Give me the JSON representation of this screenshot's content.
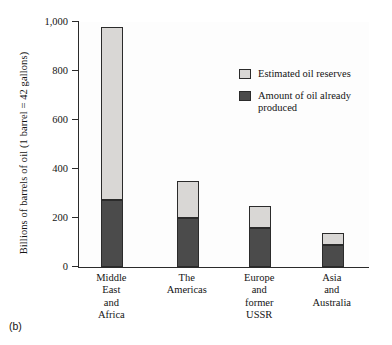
{
  "figure": {
    "panel_label": "(b)"
  },
  "legend": {
    "position": "inside-top-right",
    "entries": [
      {
        "label": "Estimated oil reserves",
        "color": "#d9d7d5",
        "swatch_name": "legend-swatch-reserves"
      },
      {
        "label": "Amount of oil already\nproduced",
        "color": "#4b4b4b",
        "swatch_name": "legend-swatch-produced"
      }
    ]
  },
  "chart_data": {
    "type": "bar",
    "subtype": "stacked",
    "title": "",
    "subtitle": "",
    "xlabel": "",
    "ylabel": "Billions of barrels of oil (1 barrel = 42 gallons)",
    "ylim": [
      0,
      1000
    ],
    "yticks": [
      0,
      200,
      400,
      600,
      800,
      1000
    ],
    "ytick_labels": [
      "0",
      "200",
      "400",
      "600",
      "800",
      "1,000"
    ],
    "grid": false,
    "legend_position": "inside-top-right",
    "categories": [
      "Middle\nEast\nand\nAfrica",
      "The\nAmericas",
      "Europe\nand\nformer\nUSSR",
      "Asia\nand\nAustralia"
    ],
    "series": [
      {
        "name": "Amount of oil already produced",
        "color": "#4b4b4b",
        "values": [
          275,
          200,
          160,
          90
        ]
      },
      {
        "name": "Estimated oil reserves",
        "color": "#d9d7d5",
        "values": [
          705,
          150,
          90,
          50
        ]
      }
    ],
    "totals": [
      980,
      350,
      250,
      140
    ]
  }
}
